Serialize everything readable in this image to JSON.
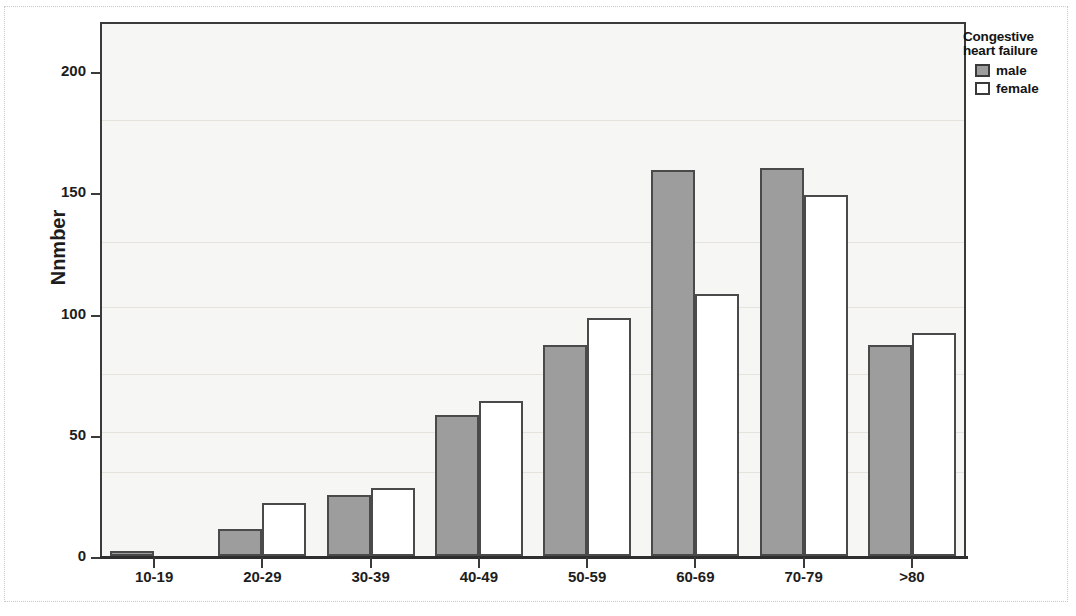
{
  "chart_data": {
    "type": "bar",
    "title": "",
    "xlabel": "",
    "ylabel": "Nnmber",
    "ylim": [
      0,
      220
    ],
    "yticks": [
      0,
      50,
      100,
      150,
      200
    ],
    "ytick_labels": [
      "0",
      "50",
      "100",
      "150",
      "200"
    ],
    "grid": false,
    "legend_position": "right",
    "legend_title": "Congestive heart failure",
    "categories": [
      "10-19",
      "20-29",
      "30-39",
      "40-49",
      "50-59",
      "60-69",
      "70-79",
      ">80"
    ],
    "series": [
      {
        "name": "male",
        "color": "#9d9d9d",
        "values": [
          2,
          11,
          25,
          58,
          87,
          159,
          160,
          87
        ]
      },
      {
        "name": "female",
        "color": "#ffffff",
        "values": [
          0,
          22,
          28,
          64,
          98,
          108,
          149,
          92
        ]
      }
    ]
  },
  "legend": {
    "title_line1": "Congestive",
    "title_line2": "heart failure",
    "entries": [
      {
        "label": "male",
        "swatch": "male-swatch-icon"
      },
      {
        "label": "female",
        "swatch": "female-swatch-icon"
      }
    ]
  }
}
